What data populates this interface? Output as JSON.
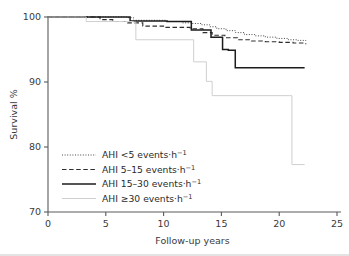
{
  "chart_data": {
    "type": "line",
    "subtype": "kaplan-meier-step",
    "title": "",
    "xlabel": "Follow-up years",
    "ylabel": "Survival %",
    "xlim": [
      0,
      25
    ],
    "ylim": [
      70,
      100
    ],
    "xticks": [
      0,
      5,
      10,
      15,
      20,
      25
    ],
    "yticks": [
      70,
      80,
      90,
      100
    ],
    "xtick_labels": [
      "0",
      "5",
      "10",
      "15",
      "20",
      "25"
    ],
    "ytick_labels": [
      "70",
      "90",
      "80",
      "100"
    ],
    "grid": false,
    "legend_position": "lower-left",
    "series": [
      {
        "name": "AHI <5 events·h−1",
        "label_main": "AHI <5 events·h",
        "label_sup": "−1",
        "style": "dotted",
        "color": "#4a4a4a",
        "x": [
          0,
          3.0,
          6.8,
          7.4,
          10.2,
          11.6,
          12.4,
          13.3,
          14.0,
          14.6,
          15.4,
          16.2,
          17.0,
          17.9,
          18.8,
          19.8,
          20.8,
          21.6,
          22.3
        ],
        "y": [
          100,
          100,
          99.9,
          99.5,
          99.3,
          99.1,
          99.0,
          98.8,
          98.5,
          98.2,
          97.9,
          97.6,
          97.3,
          97.1,
          96.9,
          96.7,
          96.5,
          96.4,
          96.3
        ]
      },
      {
        "name": "AHI 5–15 events·h−1",
        "label_main": "AHI 5–15 events·h",
        "label_sup": "−1",
        "style": "dashed",
        "color": "#2e2e2e",
        "x": [
          0,
          2.9,
          4.5,
          5.6,
          6.9,
          8.2,
          10.1,
          12.3,
          13.4,
          14.2,
          15.3,
          16.4,
          17.6,
          18.8,
          20.0,
          21.2,
          22.3
        ],
        "y": [
          100,
          100,
          99.6,
          99.3,
          99.1,
          98.6,
          98.4,
          98.2,
          97.6,
          97.2,
          96.8,
          96.5,
          96.3,
          96.2,
          96.1,
          96.0,
          95.8
        ]
      },
      {
        "name": "AHI 15–30 events·h−1",
        "label_main": "AHI 15–30 events·h",
        "label_sup": "−1",
        "style": "solid",
        "color": "#1c1c1c",
        "x": [
          0,
          3.2,
          6.8,
          7.1,
          10.3,
          12.4,
          14.1,
          15.1,
          15.6,
          16.2,
          22.2
        ],
        "y": [
          100,
          100,
          100,
          99.4,
          99.3,
          98.0,
          96.9,
          95.0,
          94.9,
          92.2,
          92.2
        ]
      },
      {
        "name": "AHI ≥30 events·h−1",
        "label_main": "AHI ≥30 events·h",
        "label_sup": "−1",
        "style": "solid-light",
        "color": "#cfcfcf",
        "x": [
          0,
          2.5,
          3.3,
          6.6,
          7.4,
          7.6,
          12.4,
          12.6,
          13.5,
          13.7,
          14.0,
          14.2,
          20.9,
          21.1,
          22.2
        ],
        "y": [
          100,
          100,
          99.3,
          99.3,
          99.2,
          96.5,
          96.5,
          93.1,
          93.1,
          90.1,
          90.1,
          87.9,
          87.9,
          77.3,
          77.3
        ]
      }
    ]
  },
  "axis": {
    "ylabel": "Survival %",
    "xlabel": "Follow-up years"
  },
  "legend": {
    "items": [
      {
        "label_main": "AHI <5 events·h",
        "label_sup": "−1",
        "style": "dotted"
      },
      {
        "label_main": "AHI 5–15 events·h",
        "label_sup": "−1",
        "style": "dashed"
      },
      {
        "label_main": "AHI 15–30 events·h",
        "label_sup": "−1",
        "style": "solid"
      },
      {
        "label_main": "AHI ≥30 events·h",
        "label_sup": "−1",
        "style": "solid-light"
      }
    ]
  },
  "colors": {
    "axis": "#5a5a5a",
    "text": "#3a3a3a",
    "series_light": "#cfcfcf",
    "background": "#ffffff"
  }
}
